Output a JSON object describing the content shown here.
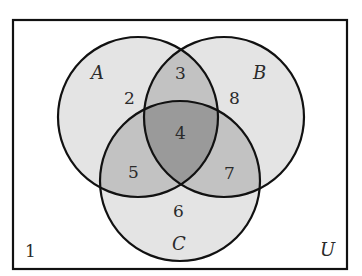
{
  "diagram": {
    "type": "venn",
    "universe_label": "U",
    "sets": [
      {
        "name": "A",
        "label": "A"
      },
      {
        "name": "B",
        "label": "B"
      },
      {
        "name": "C",
        "label": "C"
      }
    ],
    "regions": {
      "outside": "1",
      "A_only": "2",
      "A_and_B_only": "3",
      "A_B_C": "4",
      "A_and_C_only": "5",
      "C_only": "6",
      "B_and_C_only": "7",
      "B_only": "8"
    },
    "colors": {
      "single": "#e4e4e4",
      "double": "#c2c2c2",
      "triple": "#9a9a9a",
      "stroke": "#111111",
      "background": "#ffffff"
    }
  }
}
